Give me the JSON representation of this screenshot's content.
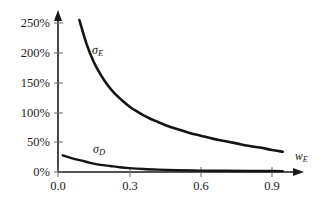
{
  "chart_data": {
    "type": "line",
    "title": "",
    "subtitle": "",
    "xlabel": "w_E",
    "ylabel": "",
    "xlim": [
      0.0,
      1.0
    ],
    "ylim": [
      0,
      265
    ],
    "grid": false,
    "legend_position": "inline-annotations",
    "x_ticks": [
      {
        "value": 0.0,
        "label": "0.0"
      },
      {
        "value": 0.3,
        "label": "0.3"
      },
      {
        "value": 0.6,
        "label": "0.6"
      },
      {
        "value": 0.9,
        "label": "0.9"
      }
    ],
    "y_ticks": [
      {
        "value": 0,
        "label": "0%"
      },
      {
        "value": 50,
        "label": "50%"
      },
      {
        "value": 100,
        "label": "100%"
      },
      {
        "value": 150,
        "label": "150%"
      },
      {
        "value": 200,
        "label": "200%"
      },
      {
        "value": 250,
        "label": "250%"
      }
    ],
    "series": [
      {
        "name": "sigma_E",
        "label": "σ",
        "label_sub": "E",
        "color": "#141414",
        "x": [
          0.09,
          0.12,
          0.15,
          0.18,
          0.21,
          0.24,
          0.27,
          0.3,
          0.33,
          0.36,
          0.39,
          0.42,
          0.45,
          0.5,
          0.55,
          0.6,
          0.65,
          0.7,
          0.75,
          0.8,
          0.85,
          0.9,
          0.945
        ],
        "values": [
          255,
          215,
          185,
          163,
          145,
          131,
          120,
          110,
          102,
          95,
          89,
          84,
          79,
          72,
          66,
          61,
          56,
          52,
          48,
          44,
          41,
          37,
          34
        ]
      },
      {
        "name": "sigma_D",
        "label": "σ",
        "label_sub": "D",
        "color": "#141414",
        "x": [
          0.02,
          0.06,
          0.1,
          0.14,
          0.18,
          0.22,
          0.26,
          0.3,
          0.36,
          0.42,
          0.5,
          0.6,
          0.7,
          0.8,
          0.9,
          0.945
        ],
        "values": [
          28,
          23,
          19,
          15,
          12,
          10,
          8,
          6.5,
          5,
          4,
          3,
          2.3,
          2,
          1.8,
          1.6,
          1.5
        ]
      }
    ],
    "annotations": [
      {
        "name": "sigma-E-label",
        "text": "σ",
        "sub": "E",
        "x": 0.18,
        "y": 205
      },
      {
        "name": "sigma-D-label",
        "text": "σ",
        "sub": "D",
        "x": 0.2,
        "y": 42
      }
    ],
    "axis_style": {
      "arrow_heads": true,
      "axis_color": "#1a1a1a",
      "background": "#ffffff"
    }
  }
}
